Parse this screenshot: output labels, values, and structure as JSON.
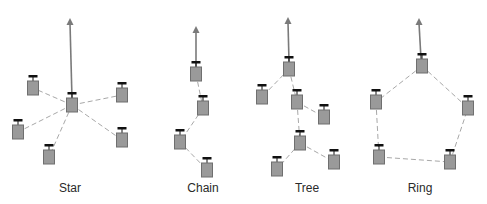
{
  "colors": {
    "node_fill": "#9a9a9a",
    "node_border": "#6f6f6f",
    "link": "#a8a8a8",
    "uplink": "#7a7a7a",
    "antenna": "#111111"
  },
  "topologies": [
    {
      "id": "star",
      "label": "Star",
      "label_x": 70,
      "uplink": {
        "from": [
          72,
          99
        ],
        "to": [
          70,
          18
        ]
      },
      "nodes": [
        [
          72,
          105
        ],
        [
          33,
          88
        ],
        [
          122,
          95
        ],
        [
          18,
          132
        ],
        [
          122,
          140
        ],
        [
          49,
          157
        ]
      ],
      "links": [
        [
          0,
          1
        ],
        [
          0,
          2
        ],
        [
          0,
          3
        ],
        [
          0,
          4
        ],
        [
          0,
          5
        ]
      ]
    },
    {
      "id": "chain",
      "label": "Chain",
      "label_x": 203,
      "uplink": {
        "from": [
          196,
          67
        ],
        "to": [
          196,
          26
        ]
      },
      "nodes": [
        [
          196,
          74
        ],
        [
          203,
          108
        ],
        [
          180,
          142
        ],
        [
          207,
          170
        ]
      ],
      "links": [
        [
          0,
          1
        ],
        [
          1,
          2
        ],
        [
          2,
          3
        ]
      ]
    },
    {
      "id": "tree",
      "label": "Tree",
      "label_x": 307,
      "uplink": {
        "from": [
          289,
          62
        ],
        "to": [
          288,
          17
        ]
      },
      "nodes": [
        [
          289,
          69
        ],
        [
          262,
          97
        ],
        [
          297,
          102
        ],
        [
          324,
          117
        ],
        [
          300,
          143
        ],
        [
          277,
          169
        ],
        [
          334,
          162
        ]
      ],
      "links": [
        [
          0,
          1
        ],
        [
          0,
          2
        ],
        [
          2,
          3
        ],
        [
          2,
          4
        ],
        [
          4,
          5
        ],
        [
          4,
          6
        ]
      ]
    },
    {
      "id": "ring",
      "label": "Ring",
      "label_x": 420,
      "uplink": {
        "from": [
          421,
          59
        ],
        "to": [
          419,
          18
        ]
      },
      "nodes": [
        [
          422,
          66
        ],
        [
          376,
          102
        ],
        [
          468,
          108
        ],
        [
          379,
          157
        ],
        [
          450,
          162
        ]
      ],
      "links": [
        [
          0,
          1
        ],
        [
          0,
          2
        ],
        [
          1,
          3
        ],
        [
          3,
          4
        ],
        [
          4,
          2
        ]
      ]
    }
  ]
}
